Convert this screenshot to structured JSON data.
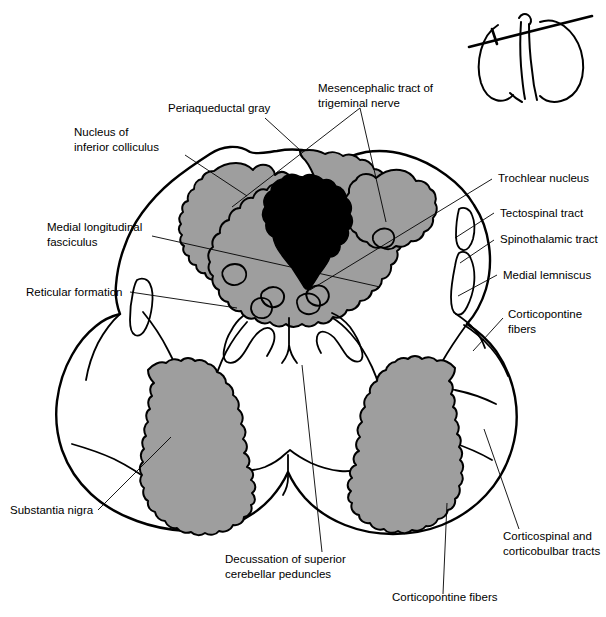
{
  "figure": {
    "colors": {
      "nucleus_gray": "#9e9e9e",
      "aqueduct_black": "#000000",
      "outline": "#000000",
      "background": "#ffffff"
    }
  },
  "labels": [
    {
      "id": "nucleus-of-inferior-colliculus",
      "lines": [
        "Nucleus of",
        "inferior colliculus"
      ],
      "x": 74,
      "y": 136,
      "anchor": "start"
    },
    {
      "id": "periaqueductal-gray",
      "lines": [
        "Periaqueductal gray"
      ],
      "x": 168,
      "y": 112,
      "anchor": "start"
    },
    {
      "id": "mesencephalic-tract-of-trigeminal-nerve",
      "lines": [
        "Mesencephalic tract of",
        "trigeminal nerve"
      ],
      "x": 318,
      "y": 92,
      "anchor": "start"
    },
    {
      "id": "trochlear-nucleus",
      "lines": [
        "Trochlear nucleus"
      ],
      "x": 498,
      "y": 182,
      "anchor": "start"
    },
    {
      "id": "tectospinal-tract",
      "lines": [
        "Tectospinal tract"
      ],
      "x": 500,
      "y": 217,
      "anchor": "start"
    },
    {
      "id": "spinothalamic-tract",
      "lines": [
        "Spinothalamic tract"
      ],
      "x": 500,
      "y": 243,
      "anchor": "start"
    },
    {
      "id": "medial-lemniscus",
      "lines": [
        "Medial lemniscus"
      ],
      "x": 503,
      "y": 279,
      "anchor": "start"
    },
    {
      "id": "corticopontine-fibers-right",
      "lines": [
        "Corticopontine",
        "fibers"
      ],
      "x": 508,
      "y": 318,
      "anchor": "start"
    },
    {
      "id": "medial-longitudinal-fasciculus",
      "lines": [
        "Medial longitudinal",
        "fasciculus"
      ],
      "x": 47,
      "y": 231,
      "anchor": "start"
    },
    {
      "id": "reticular-formation",
      "lines": [
        "Reticular formation"
      ],
      "x": 26,
      "y": 296,
      "anchor": "start"
    },
    {
      "id": "substantia-nigra",
      "lines": [
        "Substantia nigra"
      ],
      "x": 10,
      "y": 514,
      "anchor": "start"
    },
    {
      "id": "decussation-of-superior-cerebellar-peduncles",
      "lines": [
        "Decussation of superior",
        "cerebellar peduncles"
      ],
      "x": 225,
      "y": 563,
      "anchor": "start"
    },
    {
      "id": "corticopontine-fibers-bottom",
      "lines": [
        "Corticopontine fibers"
      ],
      "x": 392,
      "y": 601,
      "anchor": "start"
    },
    {
      "id": "corticospinal-and-corticobulbar-tracts",
      "lines": [
        "Corticospinal and",
        "corticobulbar tracts"
      ],
      "x": 503,
      "y": 540,
      "anchor": "start"
    }
  ],
  "leaders": [
    {
      "id": "leader-nucleus-inferior-colliculus",
      "d": "M 185 155 L 247 196"
    },
    {
      "id": "leader-periaqueductal-gray",
      "d": "M 265 118 L 300 150"
    },
    {
      "id": "leader-mesencephalic-left",
      "d": "M 360 108 L 232 207"
    },
    {
      "id": "leader-mesencephalic-right",
      "d": "M 360 108 L 386 222"
    },
    {
      "id": "leader-trochlear-nucleus",
      "d": "M 492 179 L 310 290"
    },
    {
      "id": "leader-tectospinal-tract",
      "d": "M 494 213 L 455 238"
    },
    {
      "id": "leader-spinothalamic-tract",
      "d": "M 494 240 L 460 263"
    },
    {
      "id": "leader-medial-lemniscus",
      "d": "M 497 275 L 458 296"
    },
    {
      "id": "leader-corticopontine-right",
      "d": "M 503 318 L 473 351"
    },
    {
      "id": "leader-mlf",
      "d": "M 152 236 L 380 287"
    },
    {
      "id": "leader-reticular-formation",
      "d": "M 130 292 L 237 308"
    },
    {
      "id": "leader-substantia-nigra",
      "d": "M 98 510 L 171 437"
    },
    {
      "id": "leader-decussation",
      "d": "M 322 552 L 302 365"
    },
    {
      "id": "leader-corticopontine-bottom",
      "d": "M 443 594 L 447 503"
    },
    {
      "id": "leader-corticospinal",
      "d": "M 519 529 L 484 429"
    }
  ],
  "inset": {
    "id": "brainstem-orientation-inset",
    "description": "Lateral view of brainstem with section plane line"
  }
}
